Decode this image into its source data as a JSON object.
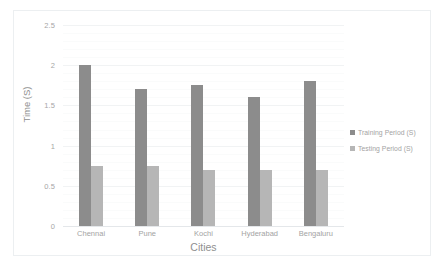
{
  "chart_data": {
    "type": "bar",
    "title": "",
    "subtitle": "",
    "xlabel": "Cities",
    "ylabel": "Time (S)",
    "categories": [
      "Chennai",
      "Pune",
      "Kochi",
      "Hyderabad",
      "Bengaluru"
    ],
    "series": [
      {
        "name": "Training Period (S)",
        "color": "#8c8c8c",
        "values": [
          2.0,
          1.7,
          1.75,
          1.6,
          1.8
        ]
      },
      {
        "name": "Testing Period (S)",
        "color": "#b6b6b6",
        "values": [
          0.75,
          0.75,
          0.7,
          0.7,
          0.7
        ]
      }
    ],
    "ylim": [
      0,
      2.5
    ],
    "yticks": [
      "0",
      "0.5",
      "1",
      "1.5",
      "2",
      "2.5"
    ],
    "ytick_values": [
      0,
      0.5,
      1,
      1.5,
      2,
      2.5
    ],
    "grid": true,
    "grid_color": "#f1f3f4",
    "legend_position": "right",
    "background": "#ffffff",
    "border_color": "#eceff1"
  }
}
